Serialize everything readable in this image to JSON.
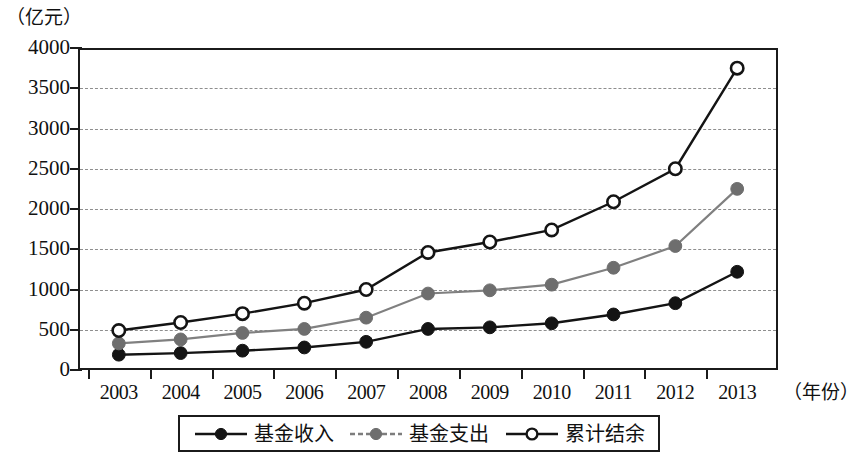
{
  "chart_data": {
    "type": "line",
    "title": "",
    "subtitle": "",
    "xlabel": "（年份）",
    "ylabel": "（亿元）",
    "categories": [
      "2003",
      "2004",
      "2005",
      "2006",
      "2007",
      "2008",
      "2009",
      "2010",
      "2011",
      "2012",
      "2013"
    ],
    "x": [
      2003,
      2004,
      2005,
      2006,
      2007,
      2008,
      2009,
      2010,
      2011,
      2012,
      2013
    ],
    "ylim": [
      0,
      4000
    ],
    "yticks": [
      "0",
      "500",
      "1000",
      "1500",
      "2000",
      "2500",
      "3000",
      "3500",
      "4000"
    ],
    "ytick_values": [
      0,
      500,
      1000,
      1500,
      2000,
      2500,
      3000,
      3500,
      4000
    ],
    "grid": true,
    "grid_style": "dashed-horizontal",
    "legend_position": "bottom",
    "series": [
      {
        "name": "基金收入",
        "marker": "filled-circle",
        "color": "#141414",
        "line_color": "#141414",
        "values": [
          190,
          210,
          240,
          280,
          350,
          510,
          530,
          580,
          690,
          830,
          1220
        ]
      },
      {
        "name": "基金支出",
        "marker": "filled-circle",
        "color": "#6e6e6e",
        "line_color": "#808080",
        "values": [
          330,
          380,
          460,
          510,
          650,
          950,
          990,
          1060,
          1270,
          1540,
          2250
        ]
      },
      {
        "name": "累计结余",
        "marker": "open-circle",
        "color": "#ffffff",
        "line_color": "#141414",
        "values": [
          490,
          590,
          700,
          830,
          1000,
          1460,
          1590,
          1740,
          2090,
          2500,
          3750
        ]
      }
    ]
  },
  "axis": {
    "unit_label": "（亿元）",
    "x_title": "（年份）"
  },
  "legend": {
    "items": [
      {
        "label": "基金收入",
        "key": "black-filled-line-marker"
      },
      {
        "label": "基金支出",
        "key": "gray-dashed-line-marker"
      },
      {
        "label": "累计结余",
        "key": "black-open-circle-line-marker"
      }
    ]
  }
}
